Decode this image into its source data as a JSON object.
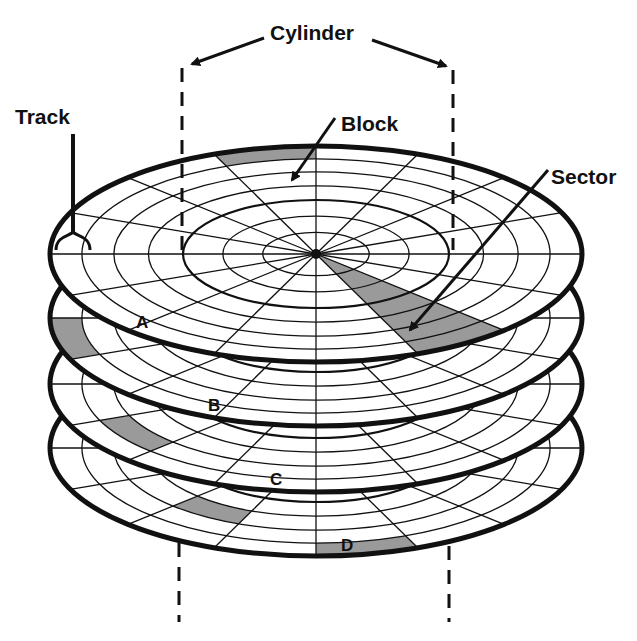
{
  "diagram": {
    "labels": {
      "cylinder": "Cylinder",
      "track": "Track",
      "block": "Block",
      "sector": "Sector"
    },
    "blocks": [
      "A",
      "B",
      "C",
      "D"
    ],
    "platter_count": 4,
    "colors": {
      "line": "#111111",
      "shade": "#9a9a9a",
      "background": "#ffffff"
    }
  }
}
